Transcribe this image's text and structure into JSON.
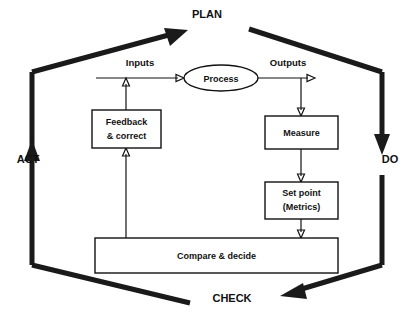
{
  "diagram": {
    "background_color": "#ffffff",
    "line_color": "#111111",
    "cycle_stages": [
      {
        "id": "plan",
        "label": "PLAN",
        "x": 207,
        "y": 18
      },
      {
        "id": "do",
        "label": "DO",
        "x": 390,
        "y": 163
      },
      {
        "id": "check",
        "label": "CHECK",
        "x": 232,
        "y": 302
      },
      {
        "id": "act",
        "label": "ACT",
        "x": 28,
        "y": 163
      }
    ],
    "flow_labels": [
      {
        "id": "inputs",
        "label": "Inputs",
        "x": 140,
        "y": 66
      },
      {
        "id": "outputs",
        "label": "Outputs",
        "x": 288,
        "y": 66
      }
    ],
    "nodes": [
      {
        "id": "process",
        "shape": "ellipse",
        "label": "Process",
        "lines": [
          "Process"
        ],
        "cx": 221,
        "cy": 78,
        "rx": 37,
        "ry": 13
      },
      {
        "id": "feedback-correct",
        "shape": "rect",
        "label": "Feedback & correct",
        "lines": [
          "Feedback",
          "& correct"
        ],
        "x": 92,
        "y": 110,
        "w": 69,
        "h": 38
      },
      {
        "id": "measure",
        "shape": "rect",
        "label": "Measure",
        "lines": [
          "Measure"
        ],
        "x": 265,
        "y": 116,
        "w": 73,
        "h": 33
      },
      {
        "id": "set-point-metrics",
        "shape": "rect",
        "label": "Set point (Metrics)",
        "lines": [
          "Set point",
          "(Metrics)"
        ],
        "x": 265,
        "y": 182,
        "w": 73,
        "h": 37
      },
      {
        "id": "compare-decide",
        "shape": "rect",
        "label": "Compare & decide",
        "lines": [
          "Compare & decide"
        ],
        "x": 95,
        "y": 238,
        "w": 243,
        "h": 35
      }
    ],
    "connections": [
      {
        "id": "inputs-to-process",
        "from": "inputs",
        "to": "process",
        "kind": "thin-arrow"
      },
      {
        "id": "process-to-outputs",
        "from": "process",
        "to": "outputs",
        "kind": "thin-arrow"
      },
      {
        "id": "outputs-to-measure",
        "from": "outputs",
        "to": "measure",
        "kind": "thin-arrow"
      },
      {
        "id": "measure-to-setpoint",
        "from": "measure",
        "to": "set-point-metrics",
        "kind": "thin-arrow"
      },
      {
        "id": "setpoint-to-compare",
        "from": "set-point-metrics",
        "to": "compare-decide",
        "kind": "thin-arrow"
      },
      {
        "id": "compare-to-feedback",
        "from": "compare-decide",
        "to": "feedback-correct",
        "kind": "thin-arrow"
      },
      {
        "id": "feedback-to-inputs",
        "from": "feedback-correct",
        "to": "inputs",
        "kind": "thin-arrow"
      },
      {
        "id": "act-to-plan",
        "from": "act",
        "to": "plan",
        "kind": "thick-arrow"
      },
      {
        "id": "plan-to-do",
        "from": "plan",
        "to": "do",
        "kind": "thick-arrow"
      },
      {
        "id": "do-to-check",
        "from": "do",
        "to": "check",
        "kind": "thick-arrow"
      },
      {
        "id": "check-to-act",
        "from": "check",
        "to": "act",
        "kind": "thick-arrow"
      }
    ]
  }
}
